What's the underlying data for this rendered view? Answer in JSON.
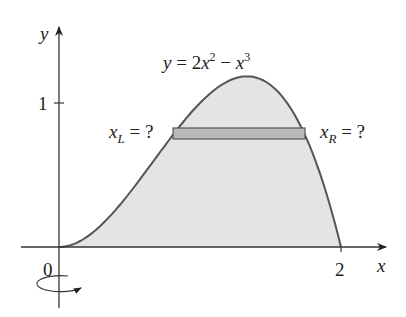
{
  "figure": {
    "equation_label": {
      "y": "y",
      "eq": " = 2",
      "x1": "x",
      "exp1": "2",
      "minus": " − ",
      "x2": "x",
      "exp2": "3"
    },
    "axes": {
      "x_label": "x",
      "y_label": "y",
      "origin_label": "0",
      "x_tick_label": "2",
      "y_tick_label": "1"
    },
    "left_label": {
      "var": "x",
      "sub": "L",
      "rest": " = ?"
    },
    "right_label": {
      "var": "x",
      "sub": "R",
      "rest": " = ?"
    },
    "rotation_indicator": "rotation-about-y-axis",
    "colors": {
      "region_fill": "#e4e4e4",
      "strip_fill": "#b8b8b8",
      "curve": "#555555",
      "axes": "#333333"
    }
  },
  "chart_data": {
    "type": "area",
    "function": "2x^2 - x^3",
    "xlabel": "x",
    "ylabel": "y",
    "xlim": [
      0,
      2
    ],
    "ylim": [
      0,
      1.19
    ],
    "x_ticks": [
      0,
      2
    ],
    "y_ticks": [
      1
    ],
    "max_point": {
      "x": 1.333,
      "y": 1.185
    },
    "strip": {
      "y": 0.8,
      "x_left": "unknown (x_L)",
      "x_right": "unknown (x_R)"
    },
    "annotations": [
      "x_L = ?",
      "x_R = ?",
      "rotation about y-axis"
    ]
  }
}
